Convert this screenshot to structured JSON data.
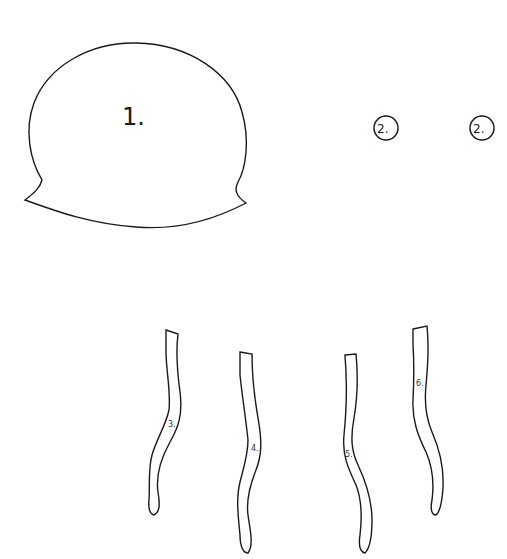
{
  "pieces": {
    "body": {
      "label": "1.",
      "shape": "jellyfish-bell"
    },
    "eyes": [
      {
        "label": "2.",
        "shape": "circle"
      },
      {
        "label": "2.",
        "shape": "circle"
      }
    ],
    "tentacles": [
      {
        "label": "3.",
        "shape": "wavy-strip"
      },
      {
        "label": "4.",
        "shape": "wavy-strip"
      },
      {
        "label": "5.",
        "shape": "wavy-strip"
      },
      {
        "label": "6.",
        "shape": "wavy-strip"
      }
    ]
  },
  "colors": {
    "outline": "#1a1a1a",
    "fill": "#ffffff",
    "background": "#ffffff"
  }
}
